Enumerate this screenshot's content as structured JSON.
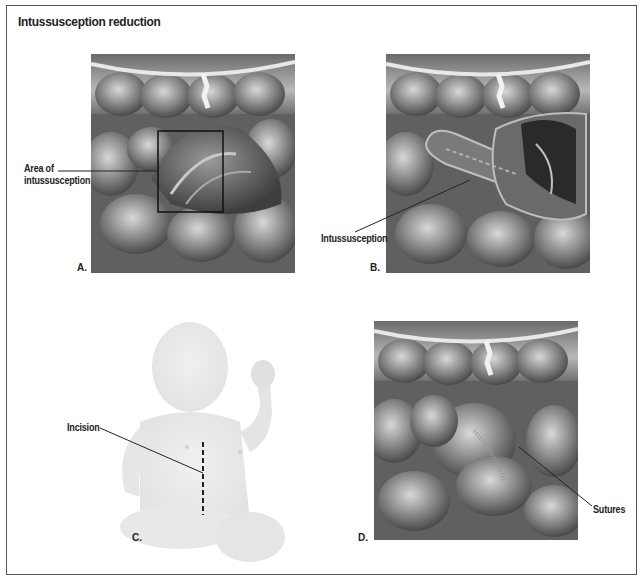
{
  "figure": {
    "title": "Intussusception reduction",
    "panels": [
      {
        "id": "A",
        "letter": "A.",
        "callout": "Area of intussusception",
        "callout_lines": [
          "Area of",
          "intussusception"
        ]
      },
      {
        "id": "B",
        "letter": "B.",
        "callout": "Intussusception"
      },
      {
        "id": "C",
        "letter": "C.",
        "callout": "Incision"
      },
      {
        "id": "D",
        "letter": "D.",
        "callout": "Sutures"
      }
    ]
  }
}
